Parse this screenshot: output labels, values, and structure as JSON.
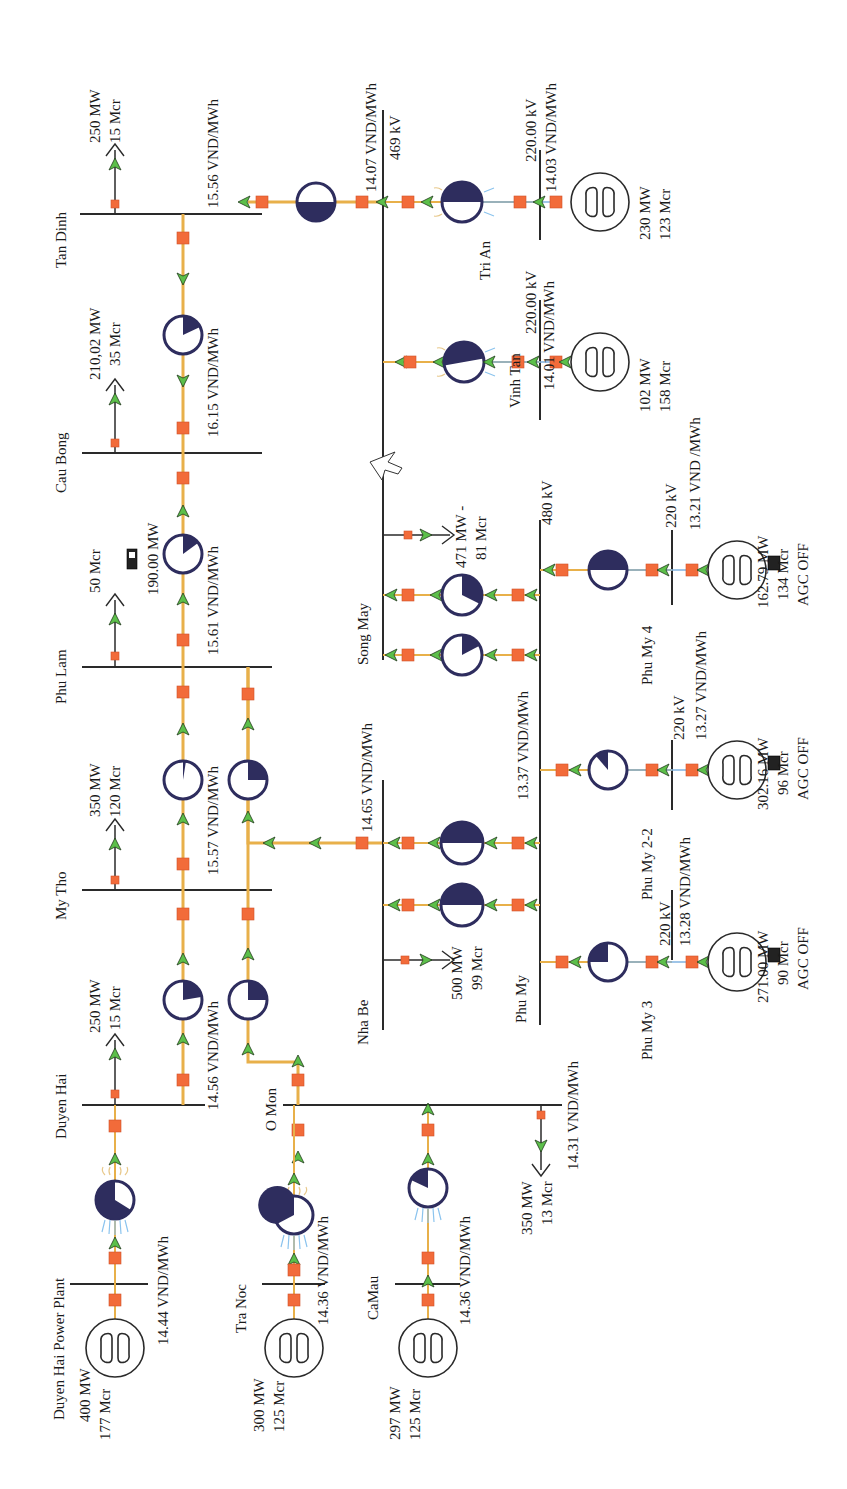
{
  "diagram": {
    "type": "power-system-one-line",
    "orientation": "rotated-90-ccw",
    "colors": {
      "flow_line": "#e8b04a",
      "breaker": "#f26b3a",
      "flow_arrow": "#5cbf4a",
      "loading_pie": "#2e2d5e",
      "bus": "#2a2a2a",
      "gen_spray": "#8cc4ee"
    }
  },
  "buses": {
    "tan_dinh": {
      "name": "Tan Dinh",
      "price": "15.56 VND/MWh"
    },
    "cau_bong": {
      "name": "Cau Bong",
      "price": "16.15 VND/MWh"
    },
    "phu_lam": {
      "name": "Phu Lam",
      "price": "15.61 VND/MWh"
    },
    "my_tho": {
      "name": "My Tho",
      "price": "15.57 VND/MWh"
    },
    "duyen_hai": {
      "name": "Duyen Hai",
      "price": "14.56 VND/MWh"
    },
    "o_mon": {
      "name": "O Mon",
      "price": "14.31 VND/MWh"
    },
    "nha_be": {
      "name": "Nha Be",
      "price": "14.65 VND/MWh"
    },
    "phu_my": {
      "name": "Phu My",
      "price": "13.37 VND/MWh",
      "voltage": "480 kV"
    },
    "song_may": {
      "name": "Song May",
      "price": "14.07 VND/MWh",
      "voltage": "469 kV"
    },
    "vinh_tan": {
      "name": "Vinh Tan",
      "price": "14.01 VND/MWh",
      "voltage": "220.00 kV"
    },
    "tri_an": {
      "name": "Tri An",
      "price": "14.03 VND/MWh",
      "voltage": "220.00 kV"
    },
    "phu_my_3": {
      "name": "Phu My 3",
      "price": "13.28 VND/MWh",
      "voltage": "220 kV"
    },
    "phu_my_2_2": {
      "name": "Phu My 2-2",
      "price": "13.27 VND/MWh",
      "voltage": "220 kV"
    },
    "phu_my_4": {
      "name": "Phu My 4",
      "price": "13.21 VND /MWh",
      "voltage": "220 kV"
    },
    "duyen_hai_pp": {
      "name": "Duyen Hai Power Plant",
      "price": "14.44 VND/MWh"
    },
    "tra_noc": {
      "name": "Tra Noc",
      "price": "14.36 VND/MWh"
    },
    "camau": {
      "name": "CaMau",
      "price": "14.36 VND/MWh"
    }
  },
  "loads": {
    "tan_dinh": {
      "mw": "250 MW",
      "mvar": "15 Mcr"
    },
    "cau_bong": {
      "mw": "210,02 MW",
      "mvar": "35 Mcr"
    },
    "phu_lam": {
      "mw": "190.00 MW",
      "mvar": "50 Mcr"
    },
    "my_tho": {
      "mw": "350 MW",
      "mvar": "120 Mcr"
    },
    "duyen_hai": {
      "mw": "250 MW",
      "mvar": "15 Mcr"
    },
    "o_mon": {
      "mw": "350 MW",
      "mvar": "13 Mcr"
    },
    "nha_be": {
      "mw": "500 MW",
      "mvar": "99 Mcr"
    },
    "song_may": {
      "mw": "471 MW -",
      "mvar": "81 Mcr"
    }
  },
  "generators": {
    "duyen_hai_pp": {
      "mw": "400 MW",
      "mvar": "177 Mcr"
    },
    "tra_noc": {
      "mw": "300 MW",
      "mvar": "125 Mcr"
    },
    "camau": {
      "mw": "297 MW",
      "mvar": "125 Mcr"
    },
    "vinh_tan": {
      "mw": "102 MW",
      "mvar": "158 Mcr"
    },
    "tri_an": {
      "mw": "230 MW",
      "mvar": "123 Mcr"
    },
    "phu_my_3": {
      "mw": "271.00 MW",
      "mvar": "90 Mcr",
      "agc": "AGC OFF"
    },
    "phu_my_2_2": {
      "mw": "302.16 MW",
      "mvar": "96 Mcr",
      "agc": "AGC OFF"
    },
    "phu_my_4": {
      "mw": "162.79 MW",
      "mvar": "134 Mcr",
      "agc": "AGC OFF"
    }
  }
}
